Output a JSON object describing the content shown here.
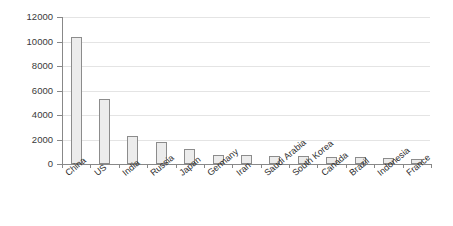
{
  "chart_data": {
    "type": "bar",
    "title": "",
    "subtitle": "",
    "xlabel": "",
    "ylabel": "",
    "ylim": [
      0,
      12000
    ],
    "y_ticks": [
      0,
      2000,
      4000,
      6000,
      8000,
      10000,
      12000
    ],
    "y_tick_labels": [
      "0",
      "2000",
      "4000",
      "6000",
      "8000",
      "10000",
      "12000"
    ],
    "grid": true,
    "legend": null,
    "legend_position": "none",
    "categories": [
      "China",
      "US",
      "India",
      "Russia",
      "Japan",
      "Germany",
      "Iran",
      "Saudi Arabia",
      "South Korea",
      "Canada",
      "Brazil",
      "Indonesia",
      "France"
    ],
    "values": [
      10400,
      5300,
      2300,
      1800,
      1200,
      750,
      700,
      650,
      640,
      600,
      560,
      480,
      380
    ],
    "series": [
      {
        "name": "",
        "values": [
          10400,
          5300,
          2300,
          1800,
          1200,
          750,
          700,
          650,
          640,
          600,
          560,
          480,
          380
        ]
      }
    ],
    "bar_fill_color": "#ececec",
    "bar_edge_color": "#8c8c8c",
    "grid_color": "#e4e4e4",
    "axis_color": "#888888",
    "background_color": "#ffffff"
  }
}
